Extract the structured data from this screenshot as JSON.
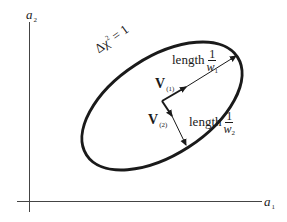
{
  "diagram": {
    "axes": {
      "x_label": "a",
      "x_label_sub": "1",
      "y_label": "a",
      "y_label_sub": "2"
    },
    "curve": {
      "label_prefix": "Δχ",
      "label_sup": "2",
      "label_suffix": "= 1",
      "shape": "tilted ellipse"
    },
    "vectors": [
      {
        "name": "V",
        "sub": "(1)",
        "length_word": "length",
        "fraction_num": "1",
        "fraction_den": "w",
        "fraction_den_sub": "1"
      },
      {
        "name": "V",
        "sub": "(2)",
        "length_word": "length",
        "fraction_num": "1",
        "fraction_den": "w",
        "fraction_den_sub": "2"
      }
    ],
    "colors": {
      "ink": "#1a1a1a",
      "axis": "#444444",
      "background": "#ffffff"
    }
  }
}
